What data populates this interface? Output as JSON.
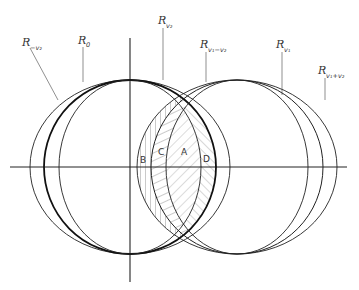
{
  "diagram": {
    "type": "overlapping-ellipses",
    "axes": {
      "horizontal": {
        "x1": 10,
        "x2": 347,
        "y": 167
      },
      "vertical": {
        "x": 130,
        "y1": 38,
        "y2": 282
      }
    },
    "ellipses": [
      {
        "name": "R_-v2",
        "cx": 130,
        "cy": 167,
        "rx": 100,
        "ry": 87,
        "bold": false
      },
      {
        "name": "R_0",
        "cx": 130,
        "cy": 167,
        "rx": 86,
        "ry": 87,
        "bold": true
      },
      {
        "name": "R_v2",
        "cx": 130,
        "cy": 167,
        "rx": 71,
        "ry": 87,
        "bold": false
      },
      {
        "name": "R_v1-v2",
        "cx": 237,
        "cy": 167,
        "rx": 100,
        "ry": 87,
        "bold": false
      },
      {
        "name": "R_v1",
        "cx": 237,
        "cy": 167,
        "rx": 86,
        "ry": 87,
        "bold": false
      },
      {
        "name": "R_v1+v2",
        "cx": 237,
        "cy": 167,
        "rx": 71,
        "ry": 87,
        "bold": false
      }
    ],
    "labels": [
      {
        "id": "r-minus-v2",
        "base": "R",
        "sub": "−v",
        "subsub": "2",
        "x": 12,
        "y": 46
      },
      {
        "id": "r-0",
        "base": "R",
        "sub": "0",
        "subsub": "",
        "x": 77,
        "y": 44
      },
      {
        "id": "r-v2",
        "base": "R",
        "sub": "v",
        "subsub": "2",
        "x": 157,
        "y": 24
      },
      {
        "id": "r-v1-minus-v2",
        "base": "R",
        "sub": "v",
        "subsub": "1",
        "tail": "−v₂",
        "x": 200,
        "y": 48
      },
      {
        "id": "r-v1",
        "base": "R",
        "sub": "v",
        "subsub": "1",
        "x": 276,
        "y": 48
      },
      {
        "id": "r-v1-plus-v2",
        "base": "R",
        "sub": "v",
        "subsub": "1",
        "tail": "+v₂",
        "x": 319,
        "y": 74
      }
    ],
    "label_text": {
      "r_minus_v2": "R",
      "r_minus_v2_sub": "−v₂",
      "r_0": "R",
      "r_0_sub": "0",
      "r_v2": "R",
      "r_v2_sub": "v₂",
      "r_v1_minus_v2": "R",
      "r_v1_minus_v2_sub": "v₁−v₂",
      "r_v1": "R",
      "r_v1_sub": "v₁",
      "r_v1_plus_v2": "R",
      "r_v1_plus_v2_sub": "v₁+v₂"
    },
    "regions": {
      "A": "A",
      "B": "B",
      "C": "C",
      "D": "D"
    },
    "colors": {
      "stroke": "#222222",
      "hatch": "#555555",
      "background": "#ffffff"
    }
  }
}
